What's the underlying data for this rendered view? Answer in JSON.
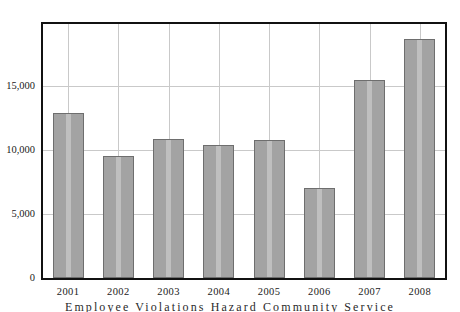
{
  "chart_data": {
    "type": "bar",
    "title": "",
    "subtitle": "",
    "xlabel": "",
    "ylabel": "",
    "categories": [
      "2001",
      "2002",
      "2003",
      "2004",
      "2005",
      "2006",
      "2007",
      "2008"
    ],
    "values": [
      12900,
      9500,
      10900,
      10400,
      10800,
      7000,
      15500,
      18700
    ],
    "series": [
      {
        "name": "",
        "values": [
          12900,
          9500,
          10900,
          10400,
          10800,
          7000,
          15500,
          18700
        ]
      }
    ],
    "ylim": [
      0,
      19850
    ],
    "ytick_values": [
      0,
      5000,
      10000,
      15000
    ],
    "ytick_labels": [
      "0",
      "5,000",
      "10,000",
      "15,000"
    ],
    "xtick_labels": [
      "2001",
      "2002",
      "2003",
      "2004",
      "2005",
      "2006",
      "2007",
      "2008"
    ],
    "grid": true,
    "grid_horizontal": true,
    "grid_vertical": true,
    "legend": null,
    "legend_position": "none",
    "annotations": [],
    "bar_fill_color": "#a3a3a3",
    "bar_border_color": "#6e6e6e",
    "grid_color": "#c9c9c9",
    "frame_color": "#111111",
    "background_color": "#ffffff"
  },
  "caption": {
    "text": "Employee Violations Hazard Community Service"
  }
}
